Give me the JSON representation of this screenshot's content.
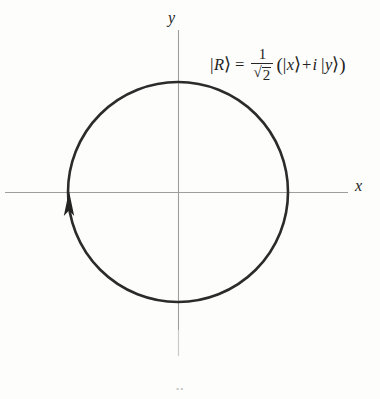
{
  "figure": {
    "background_color": "#fdfdfc",
    "axes": {
      "x_label": "x",
      "y_label": "y",
      "axis_color": "#9a9a9a",
      "origin": {
        "x": 178,
        "y": 192
      },
      "x_axis": {
        "from": 5,
        "to": 348
      },
      "y_axis": {
        "from": 30,
        "to": 356
      }
    },
    "circle": {
      "center_x": 178,
      "center_y": 192,
      "radius": 110,
      "stroke_color": "#2b2b2b",
      "stroke_width": 2.6,
      "fill": "none",
      "direction": "counterclockwise"
    },
    "arrow": {
      "name": "rotation-direction-arrow",
      "points": "up",
      "tip_x": 69,
      "tip_y": 192,
      "color": "#232323"
    },
    "formula": {
      "ket_R_open": "|",
      "ket_R_symbol": "R",
      "ket_R_close": "⟩",
      "equals": "=",
      "fraction_numerator": "1",
      "fraction_denominator_sqrt": "√",
      "fraction_denominator_radicand": "2",
      "group_open": "(",
      "ket_x_open": "|",
      "ket_x_symbol": "x",
      "ket_x_close": "⟩",
      "plus": "+",
      "imaginary_unit": "i",
      "ket_y_open": "|",
      "ket_y_symbol": "y",
      "ket_y_close": "⟩",
      "group_close": ")",
      "plain_text": "|R⟩ = (1/√2)(|x⟩ + i|y⟩)",
      "color": "#232323"
    },
    "artifact": {
      "label": "••"
    }
  }
}
